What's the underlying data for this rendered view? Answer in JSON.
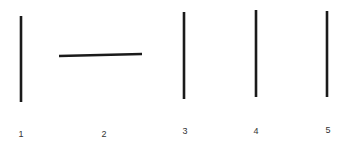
{
  "figure": {
    "line_color": "#1a1a1a",
    "items": [
      {
        "label": "1",
        "orientation": "vertical",
        "x1": 21,
        "y1": 16,
        "x2": 21,
        "y2": 102,
        "lx": 21,
        "ly": 137
      },
      {
        "label": "2",
        "orientation": "horizontal",
        "x1": 59,
        "y1": 56,
        "x2": 142,
        "y2": 54,
        "lx": 104,
        "ly": 137
      },
      {
        "label": "3",
        "orientation": "vertical",
        "x1": 184,
        "y1": 12,
        "x2": 184,
        "y2": 99,
        "lx": 185,
        "ly": 134
      },
      {
        "label": "4",
        "orientation": "vertical",
        "x1": 256,
        "y1": 10,
        "x2": 256,
        "y2": 97,
        "lx": 256,
        "ly": 134
      },
      {
        "label": "5",
        "orientation": "vertical",
        "x1": 327,
        "y1": 11,
        "x2": 327,
        "y2": 97,
        "lx": 328,
        "ly": 133
      }
    ]
  }
}
